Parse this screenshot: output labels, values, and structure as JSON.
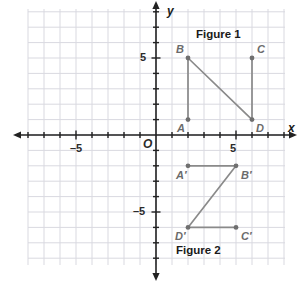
{
  "diagram": {
    "figure1_label": "Figure 1",
    "figure2_label": "Figure 2"
  },
  "axes": {
    "x_axis_label": "x",
    "y_axis_label": "y",
    "origin_label": "O",
    "x_ticks": [
      {
        "value": -5,
        "label": "–5"
      },
      {
        "value": 5,
        "label": "5"
      }
    ],
    "y_ticks": [
      {
        "value": 5,
        "label": "5"
      },
      {
        "value": -5,
        "label": "–5"
      }
    ],
    "x_range": [
      -8,
      8
    ],
    "y_range": [
      -8,
      8
    ],
    "grid": true,
    "grid_color": "#d9d9e0",
    "axis_color": "#222222"
  },
  "figure1": {
    "name": "Figure 1",
    "stroke_color": "#8a8a8a",
    "points": [
      {
        "label": "A",
        "x": 2,
        "y": 1,
        "label_dx": -11,
        "label_dy": 11
      },
      {
        "label": "B",
        "x": 2,
        "y": 5,
        "label_dx": -12,
        "label_dy": -6
      },
      {
        "label": "C",
        "x": 6,
        "y": 5,
        "label_dx": 5,
        "label_dy": -6
      },
      {
        "label": "D",
        "x": 6,
        "y": 1,
        "label_dx": 4,
        "label_dy": 11
      }
    ],
    "segments": [
      {
        "from": "A",
        "to": "B"
      },
      {
        "from": "B",
        "to": "D"
      },
      {
        "from": "C",
        "to": "D"
      }
    ]
  },
  "figure2": {
    "name": "Figure 2",
    "stroke_color": "#8a8a8a",
    "points": [
      {
        "label": "A′",
        "x": 2,
        "y": -2,
        "label_dx": -12,
        "label_dy": 12
      },
      {
        "label": "B′",
        "x": 5,
        "y": -2,
        "label_dx": 5,
        "label_dy": 12
      },
      {
        "label": "C′",
        "x": 5,
        "y": -6,
        "label_dx": 5,
        "label_dy": 12
      },
      {
        "label": "D′",
        "x": 2,
        "y": -6,
        "label_dx": -13,
        "label_dy": 12
      }
    ],
    "segments": [
      {
        "from": "A′",
        "to": "B′"
      },
      {
        "from": "B′",
        "to": "D′"
      },
      {
        "from": "C′",
        "to": "D′"
      }
    ]
  },
  "chart_data": {
    "type": "scatter",
    "title": "",
    "xlabel": "x",
    "ylabel": "y",
    "xlim": [
      -8,
      8
    ],
    "ylim": [
      -8,
      8
    ],
    "grid": true,
    "series": [
      {
        "name": "Figure 1",
        "points": [
          [
            2,
            1
          ],
          [
            2,
            5
          ],
          [
            6,
            5
          ],
          [
            6,
            1
          ]
        ],
        "point_labels": [
          "A",
          "B",
          "C",
          "D"
        ]
      },
      {
        "name": "Figure 2",
        "points": [
          [
            2,
            -2
          ],
          [
            5,
            -2
          ],
          [
            5,
            -6
          ],
          [
            2,
            -6
          ]
        ],
        "point_labels": [
          "A′",
          "B′",
          "C′",
          "D′"
        ]
      }
    ]
  },
  "layout": {
    "origin_px": {
      "x": 156,
      "y": 135
    },
    "unit_px": {
      "x": 16,
      "y": 15.4
    },
    "grid_rect": {
      "left": 28,
      "top": 9,
      "right": 285,
      "bottom": 265
    },
    "figure1_label_pos": {
      "x": 196,
      "y": 28
    },
    "figure2_label_pos": {
      "x": 176,
      "y": 244
    },
    "x_axis_label_pos": {
      "x": 288,
      "y": 122
    },
    "y_axis_label_pos": {
      "x": 167,
      "y": 5
    },
    "origin_label_pos": {
      "x": 143,
      "y": 139
    }
  }
}
